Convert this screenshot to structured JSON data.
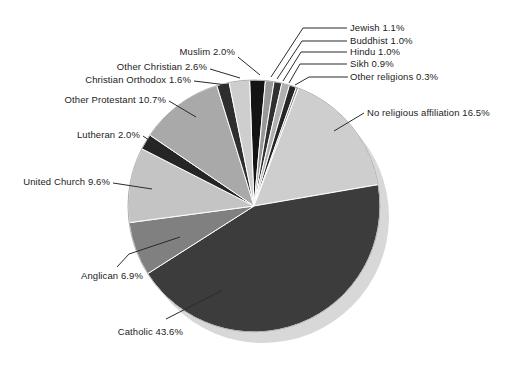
{
  "figure": {
    "background": "#ffffff",
    "width": 516,
    "height": 367,
    "title": ""
  },
  "chart_data": {
    "type": "pie",
    "title": "",
    "unit": "percent",
    "total_percent": 99.8,
    "categories": [
      "Muslim",
      "Jewish",
      "Buddhist",
      "Hindu",
      "Sikh",
      "Other religions",
      "No religious affiliation",
      "Catholic",
      "Anglican",
      "United Church",
      "Lutheran",
      "Other Protestant",
      "Christian Orthodox",
      "Other Christian"
    ],
    "values": [
      2.0,
      1.1,
      1.0,
      1.0,
      0.9,
      0.3,
      16.5,
      43.6,
      6.9,
      9.6,
      2.0,
      10.7,
      1.6,
      2.6
    ],
    "layout": {
      "center": {
        "x": 254,
        "y": 206
      },
      "radius": 126,
      "start_angle_deg": -2,
      "direction": "clockwise",
      "shadow": {
        "dx": 9,
        "dy": 11,
        "color": "#d8d8d8"
      },
      "slice_gap_color": "#ffffff",
      "slice_gap_width": 1,
      "outline_color": "#9c9c9c",
      "leader_color": "#2b2b2b",
      "label_color": "#1c1c1c"
    },
    "slices": [
      {
        "id": "muslim",
        "label": "Muslim",
        "value": 2.0,
        "display": "Muslim 2.0%",
        "color": "#141414",
        "label_x": 235,
        "label_y": 52,
        "anchor": "end",
        "leader": [
          [
            238,
            57
          ],
          [
            260,
            75
          ]
        ]
      },
      {
        "id": "jewish",
        "label": "Jewish",
        "value": 1.1,
        "display": "Jewish 1.1%",
        "color": "#989898",
        "label_x": 350,
        "label_y": 28,
        "anchor": "start",
        "leader": [
          [
            347,
            28
          ],
          [
            303,
            28
          ],
          [
            271,
            77
          ]
        ]
      },
      {
        "id": "buddhist",
        "label": "Buddhist",
        "value": 1.0,
        "display": "Buddhist 1.0%",
        "color": "#303030",
        "label_x": 350,
        "label_y": 41,
        "anchor": "start",
        "leader": [
          [
            347,
            41
          ],
          [
            302,
            41
          ],
          [
            277,
            79
          ]
        ]
      },
      {
        "id": "hindu",
        "label": "Hindu",
        "value": 1.0,
        "display": "Hindu 1.0%",
        "color": "#b0b0b0",
        "label_x": 350,
        "label_y": 52,
        "anchor": "start",
        "leader": [
          [
            347,
            52
          ],
          [
            301,
            52
          ],
          [
            283,
            81
          ]
        ]
      },
      {
        "id": "sikh",
        "label": "Sikh",
        "value": 0.9,
        "display": "Sikh 0.9%",
        "color": "#262626",
        "label_x": 350,
        "label_y": 64,
        "anchor": "start",
        "leader": [
          [
            347,
            64
          ],
          [
            300,
            64
          ],
          [
            289,
            83
          ]
        ]
      },
      {
        "id": "other-religions",
        "label": "Other religions",
        "value": 0.3,
        "display": "Other religions 0.3%",
        "color": "#8c8c8c",
        "label_x": 350,
        "label_y": 77,
        "anchor": "start",
        "leader": [
          [
            348,
            77
          ],
          [
            309,
            77
          ],
          [
            295,
            85
          ]
        ]
      },
      {
        "id": "no-religious-affiliation",
        "label": "No religious affiliation",
        "value": 16.5,
        "display": "No religious affiliation 16.5%",
        "color": "#cecece",
        "label_x": 367,
        "label_y": 113,
        "anchor": "start",
        "leader": [
          [
            364,
            113
          ],
          [
            334,
            131
          ]
        ]
      },
      {
        "id": "catholic",
        "label": "Catholic",
        "value": 43.6,
        "display": "Catholic 43.6%",
        "color": "#3c3c3c",
        "label_x": 183,
        "label_y": 332,
        "anchor": "end",
        "leader": [
          [
            166,
            319
          ],
          [
            223,
            290
          ]
        ]
      },
      {
        "id": "anglican",
        "label": "Anglican",
        "value": 6.9,
        "display": "Anglican 6.9%",
        "color": "#808080",
        "label_x": 143,
        "label_y": 276,
        "anchor": "end",
        "leader": [
          [
            117,
            267
          ],
          [
            129,
            254
          ],
          [
            180,
            237
          ]
        ]
      },
      {
        "id": "united-church",
        "label": "United Church",
        "value": 9.6,
        "display": "United Church 9.6%",
        "color": "#c4c4c4",
        "label_x": 110,
        "label_y": 182,
        "anchor": "end",
        "leader": [
          [
            113,
            183
          ],
          [
            152,
            189
          ]
        ]
      },
      {
        "id": "lutheran",
        "label": "Lutheran",
        "value": 2.0,
        "display": "Lutheran 2.0%",
        "color": "#252525",
        "label_x": 140,
        "label_y": 135,
        "anchor": "end",
        "leader": [
          [
            143,
            136
          ],
          [
            165,
            151
          ]
        ]
      },
      {
        "id": "other-protestant",
        "label": "Other Protestant",
        "value": 10.7,
        "display": "Other Protestant 10.7%",
        "color": "#a9a9a9",
        "label_x": 166,
        "label_y": 100,
        "anchor": "end",
        "leader": [
          [
            169,
            101
          ],
          [
            196,
            117
          ]
        ]
      },
      {
        "id": "christian-orthodox",
        "label": "Christian Orthodox",
        "value": 1.6,
        "display": "Christian Orthodox 1.6%",
        "color": "#2e2e2e",
        "label_x": 191,
        "label_y": 80,
        "anchor": "end",
        "leader": [
          [
            194,
            81
          ],
          [
            227,
            85
          ]
        ]
      },
      {
        "id": "other-christian",
        "label": "Other Christian",
        "value": 2.6,
        "display": "Other Christian 2.6%",
        "color": "#cecece",
        "label_x": 207,
        "label_y": 67,
        "anchor": "end",
        "leader": [
          [
            210,
            69
          ],
          [
            240,
            78
          ]
        ]
      }
    ]
  }
}
